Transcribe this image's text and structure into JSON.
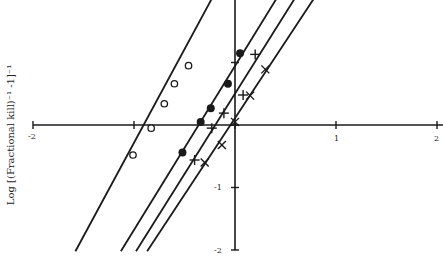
{
  "chart_data": {
    "type": "scatter",
    "title": "",
    "xlabel": "",
    "ylabel": "Log [(Fractional kill)^-1 -1]^-1",
    "xlim": [
      -2,
      2
    ],
    "ylim": [
      -2,
      2
    ],
    "x_ticks": [
      -2,
      -1,
      0,
      1,
      2
    ],
    "x_tick_labels": [
      "-2",
      "",
      "",
      "1",
      "2"
    ],
    "y_ticks": [
      -2,
      -1,
      0,
      1
    ],
    "y_tick_labels": [
      "-2",
      "-1",
      "",
      ""
    ],
    "grid": false,
    "legend": "none",
    "series": [
      {
        "name": "open circles",
        "marker": "open-circle",
        "points": [
          [
            -1.01,
            -0.48
          ],
          [
            -0.83,
            -0.05
          ],
          [
            -0.7,
            0.34
          ],
          [
            -0.6,
            0.66
          ],
          [
            -0.46,
            0.95
          ]
        ],
        "fit_line": [
          [
            -1.58,
            -2.02
          ],
          [
            -0.23,
            2.02
          ]
        ]
      },
      {
        "name": "filled circles",
        "marker": "filled-circle",
        "points": [
          [
            -0.52,
            -0.44
          ],
          [
            -0.34,
            0.05
          ],
          [
            -0.24,
            0.27
          ],
          [
            -0.07,
            0.66
          ],
          [
            0.05,
            1.15
          ]
        ],
        "fit_line": [
          [
            -1.13,
            -2.02
          ],
          [
            0.41,
            2.02
          ]
        ]
      },
      {
        "name": "plus",
        "marker": "plus",
        "points": [
          [
            -0.4,
            -0.56
          ],
          [
            -0.23,
            -0.05
          ],
          [
            -0.11,
            0.19
          ],
          [
            0.08,
            0.48
          ],
          [
            0.2,
            1.13
          ]
        ],
        "fit_line": [
          [
            -0.98,
            -2.02
          ],
          [
            0.59,
            2.02
          ]
        ]
      },
      {
        "name": "cross",
        "marker": "cross",
        "points": [
          [
            -0.3,
            -0.6
          ],
          [
            -0.13,
            -0.32
          ],
          [
            0.0,
            0.05
          ],
          [
            0.15,
            0.47
          ],
          [
            0.3,
            0.89
          ]
        ],
        "fit_line": [
          [
            -0.87,
            -2.02
          ],
          [
            0.78,
            2.02
          ]
        ]
      }
    ]
  },
  "labels": {
    "ylabel": "Log [(Fractional kill)⁻¹ -1]⁻¹",
    "x_neg2": "-2",
    "x_1": "1",
    "x_2": "2",
    "y_neg1": "-1",
    "y_neg2": "-2"
  }
}
